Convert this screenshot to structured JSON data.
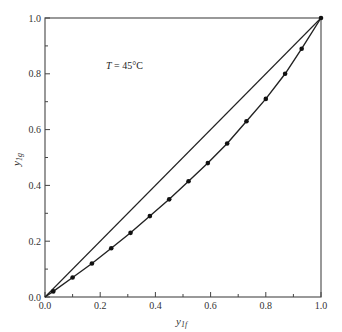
{
  "chart_data": {
    "type": "line",
    "title": "",
    "annotation": "T = 45°C",
    "annotation_var": "T",
    "annotation_rest": " = 45°C",
    "xlabel": "y",
    "xlabel_sub": "1f",
    "ylabel": "y",
    "ylabel_sub": "1g",
    "xlim": [
      0.0,
      1.0
    ],
    "ylim": [
      0.0,
      1.0
    ],
    "x_ticks": [
      "0.0",
      "0.2",
      "0.4",
      "0.6",
      "0.8",
      "1.0"
    ],
    "y_ticks": [
      "0.0",
      "0.2",
      "0.4",
      "0.6",
      "0.8",
      "1.0"
    ],
    "grid": false,
    "legend": null,
    "series": [
      {
        "name": "diagonal (y = x)",
        "x": [
          0.0,
          1.0
        ],
        "y": [
          0.0,
          1.0
        ],
        "markers": false
      },
      {
        "name": "data",
        "markers": true,
        "x": [
          0.0,
          0.03,
          0.1,
          0.17,
          0.24,
          0.31,
          0.38,
          0.45,
          0.52,
          0.59,
          0.66,
          0.73,
          0.8,
          0.87,
          0.93,
          1.0
        ],
        "y": [
          0.0,
          0.02,
          0.07,
          0.12,
          0.175,
          0.23,
          0.29,
          0.35,
          0.415,
          0.48,
          0.55,
          0.63,
          0.71,
          0.8,
          0.89,
          1.0
        ]
      }
    ]
  }
}
